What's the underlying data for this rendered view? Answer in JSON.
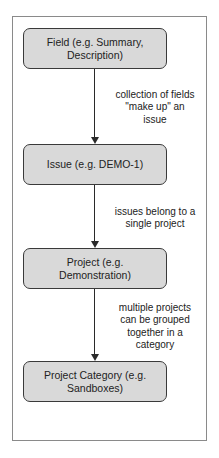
{
  "diagram": {
    "type": "hierarchy-flow",
    "nodes": [
      {
        "id": "field",
        "label": "Field (e.g. Summary,\nDescription)"
      },
      {
        "id": "issue",
        "label": "Issue (e.g. DEMO-1)"
      },
      {
        "id": "project",
        "label": "Project (e.g.\nDemonstration)"
      },
      {
        "id": "project-category",
        "label": "Project Category (e.g.\nSandboxes)"
      }
    ],
    "edges": [
      {
        "from": "field",
        "to": "issue",
        "label": "collection of fields\n\"make up\" an\nissue"
      },
      {
        "from": "issue",
        "to": "project",
        "label": "issues belong to a\nsingle project"
      },
      {
        "from": "project",
        "to": "project-category",
        "label": "multiple projects\ncan be grouped\ntogether in a\ncategory"
      }
    ]
  },
  "colors": {
    "node_fill": "#d9d9d9",
    "node_border": "#3a3a3a",
    "frame_border": "#8a8a8a",
    "edge": "#2a2a2a"
  }
}
